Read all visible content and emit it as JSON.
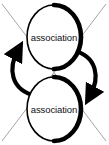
{
  "diagram": {
    "type": "cycle-diagram",
    "background_color": "#ffffff",
    "canvas": {
      "width": 109,
      "height": 145
    },
    "nodes": [
      {
        "id": "node-top",
        "label": "association",
        "shape": "ellipse",
        "center": {
          "x": 54,
          "y": 37
        },
        "radius": {
          "x": 27,
          "y": 32
        },
        "stroke_color": "#000000",
        "fill_color": "#ffffff"
      },
      {
        "id": "node-bottom",
        "label": "association",
        "shape": "ellipse",
        "center": {
          "x": 54,
          "y": 109
        },
        "radius": {
          "x": 27,
          "y": 32
        },
        "stroke_color": "#000000",
        "fill_color": "#ffffff"
      }
    ],
    "edges": [
      {
        "id": "edge-left-up",
        "from": "node-bottom",
        "to": "node-top",
        "direction": "up",
        "side": "left",
        "style": "thick-curve-with-arrowhead",
        "stroke_color": "#000000"
      },
      {
        "id": "edge-right-down",
        "from": "node-top",
        "to": "node-bottom",
        "direction": "down",
        "side": "right",
        "style": "thick-curve-with-arrowhead",
        "stroke_color": "#000000"
      }
    ],
    "crossing_lines": [
      {
        "id": "cross-line-nw-se",
        "from": {
          "x": 2,
          "y": 4
        },
        "to": {
          "x": 106,
          "y": 141
        },
        "stroke_color": "#9a9a9a"
      },
      {
        "id": "cross-line-ne-sw",
        "from": {
          "x": 106,
          "y": 4
        },
        "to": {
          "x": 2,
          "y": 141
        },
        "stroke_color": "#9a9a9a"
      }
    ]
  }
}
